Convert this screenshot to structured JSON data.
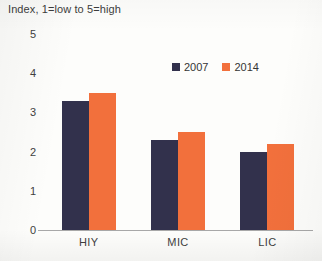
{
  "chart_data": {
    "type": "bar",
    "title": "Index, 1=low to 5=high",
    "xlabel": "",
    "ylabel": "",
    "categories": [
      "HIY",
      "MIC",
      "LIC"
    ],
    "series": [
      {
        "name": "2007",
        "color": "#32314c",
        "values": [
          3.3,
          2.3,
          2.0
        ]
      },
      {
        "name": "2014",
        "color": "#f2703c",
        "values": [
          3.5,
          2.5,
          2.2
        ]
      }
    ],
    "ylim": [
      0,
      5
    ],
    "yticks": [
      0,
      1,
      2,
      3,
      4,
      5
    ],
    "ytick_labels": [
      "0",
      "1",
      "2",
      "3",
      "4",
      "5"
    ],
    "grid": false,
    "legend_position": "top-right"
  },
  "legend": {
    "items": [
      {
        "label": "2007",
        "color": "#32314c"
      },
      {
        "label": "2014",
        "color": "#f2703c"
      }
    ]
  }
}
